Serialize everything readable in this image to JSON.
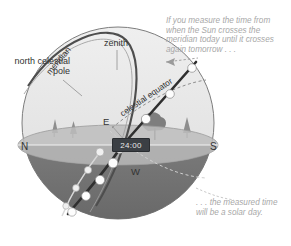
{
  "figure": {
    "captions": {
      "top": "If you measure the time from when the Sun crosses the meridian today until it crosses again tomorrow . . .",
      "bottom": ". . . the measured time will be a solar day."
    },
    "labels": {
      "north_celestial_pole": "north celestial pole",
      "zenith": "zenith",
      "meridian": "meridian",
      "celestial_equator": "celestial equator",
      "compass_north": "N",
      "compass_south": "S",
      "compass_east": "E",
      "compass_west": "W"
    },
    "clock": {
      "value": "24:00"
    },
    "colors": {
      "sky_upper": "#e9e9e9",
      "sphere_lower": "#6d6d6d",
      "horizon_plane": "#bdbdbd",
      "meridian_line": "#4a4a4a",
      "sun_path": "#2f2f2f",
      "sun_marker": "#fdfdfd",
      "caption_text": "#a8a8a8",
      "label_text": "#333333",
      "clock_bg": "#3b3f44",
      "clock_text": "#e8e8e8"
    },
    "sun_markers_upper": 4,
    "sun_markers_lower": 5,
    "star_track_markers": 5
  }
}
